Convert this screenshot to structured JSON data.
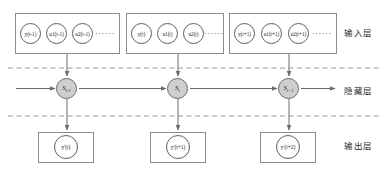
{
  "diagram": {
    "colors": {
      "hidden_node_fill": "#cfcfcf",
      "stroke": "#8c8c8c",
      "node_stroke": "#5e5e5e",
      "arrow": "#6b6b6b",
      "dashed_separator": "#8c8c8c",
      "text": "#1a1a1a",
      "background": "#ffffff"
    },
    "layers": [
      {
        "name": "input-layer",
        "label": "输入层"
      },
      {
        "name": "hidden-layer",
        "label": "隐藏层"
      },
      {
        "name": "output-layer",
        "label": "输出层"
      }
    ],
    "input_groups": [
      {
        "time": "t-1",
        "nodes": [
          {
            "name": "y(t-1)",
            "base": "y",
            "sub": "",
            "arg": "(t-1)"
          },
          {
            "name": "u1(t-1)",
            "base": "u",
            "sub": "1",
            "arg": "(t-1)"
          },
          {
            "name": "u2(t-1)",
            "base": "u",
            "sub": "2",
            "arg": "(t-1)"
          }
        ],
        "ellipsis": "······"
      },
      {
        "time": "t",
        "nodes": [
          {
            "name": "y(t)",
            "base": "y",
            "sub": "",
            "arg": "(t)"
          },
          {
            "name": "u1(t)",
            "base": "u",
            "sub": "1",
            "arg": "(t)"
          },
          {
            "name": "u2(t)",
            "base": "u",
            "sub": "2",
            "arg": "(t)"
          }
        ],
        "ellipsis": "······"
      },
      {
        "time": "t+1",
        "nodes": [
          {
            "name": "y(t+1)",
            "base": "y",
            "sub": "",
            "arg": "(t+1)"
          },
          {
            "name": "u1(t+1)",
            "base": "u",
            "sub": "1",
            "arg": "(t+1)"
          },
          {
            "name": "u2(t+1)",
            "base": "u",
            "sub": "2",
            "arg": "(t+1)"
          }
        ],
        "ellipsis": "······"
      }
    ],
    "hidden_nodes": [
      {
        "name": "S(t-1)",
        "base": "S",
        "sub": "t-1"
      },
      {
        "name": "S(t)",
        "base": "S",
        "sub": "t"
      },
      {
        "name": "S(t+1)",
        "base": "S",
        "sub": "t+1"
      }
    ],
    "output_nodes": [
      {
        "name": "y'(t)",
        "base": "y",
        "prime": "'",
        "arg": "(t)"
      },
      {
        "name": "y'(t+1)",
        "base": "y",
        "prime": "'",
        "arg": "(t+1)"
      },
      {
        "name": "y'(t+2)",
        "base": "y",
        "prime": "'",
        "arg": "(t+2)"
      }
    ]
  }
}
